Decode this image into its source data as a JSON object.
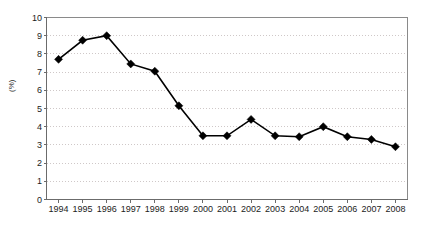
{
  "chart_data": {
    "type": "line",
    "title": "",
    "subtitle": "",
    "xlabel": "",
    "ylabel": "(%)",
    "categories": [
      "1994",
      "1995",
      "1996",
      "1997",
      "1998",
      "1999",
      "2000",
      "2001",
      "2002",
      "2003",
      "2004",
      "2005",
      "2006",
      "2007",
      "2008"
    ],
    "values": [
      7.7,
      8.75,
      9.0,
      7.45,
      7.05,
      5.15,
      3.5,
      3.5,
      4.4,
      3.5,
      3.45,
      4.0,
      3.45,
      3.3,
      2.9
    ],
    "series": [
      {
        "name": "",
        "values": [
          7.7,
          8.75,
          9.0,
          7.45,
          7.05,
          5.15,
          3.5,
          3.5,
          4.4,
          3.5,
          3.45,
          4.0,
          3.45,
          3.3,
          2.9
        ]
      }
    ],
    "ylim": [
      0,
      10
    ],
    "ytick_values": [
      10,
      9,
      8,
      7,
      6,
      5,
      4,
      3,
      2,
      1,
      0
    ],
    "ytick_labels": [
      "10",
      "9",
      "8",
      "7",
      "6",
      "5",
      "4",
      "3",
      "2",
      "1",
      "0"
    ],
    "grid": {
      "horizontal": true,
      "vertical": false,
      "style": "dotted",
      "color": "#cfc8c8"
    },
    "legend": {
      "visible": false,
      "position": "none",
      "entries": []
    },
    "annotations": [],
    "style": {
      "line_color": "#000000",
      "line_width": 1.6,
      "marker": "diamond",
      "marker_color": "#000000",
      "marker_size": 4,
      "frame_color": "#8a8a8a",
      "background": "#ffffff",
      "text_color": "#1c1c1c"
    }
  }
}
